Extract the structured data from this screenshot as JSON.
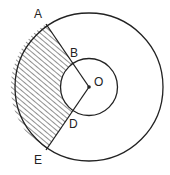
{
  "diagram": {
    "type": "concentric-circles-shaded-region",
    "center": {
      "label": "O",
      "x": 89,
      "y": 87
    },
    "outer_circle": {
      "r": 74
    },
    "inner_circle": {
      "r": 28.5
    },
    "points": [
      {
        "label": "A",
        "x": 46,
        "y": 24,
        "on": "outer"
      },
      {
        "label": "B",
        "x": 73,
        "y": 63,
        "on": "inner"
      },
      {
        "label": "O",
        "x": 89,
        "y": 87,
        "on": "center"
      },
      {
        "label": "D",
        "x": 73,
        "y": 111,
        "on": "inner"
      },
      {
        "label": "E",
        "x": 46,
        "y": 150,
        "on": "outer"
      }
    ],
    "segments": [
      "A-O",
      "E-O"
    ],
    "shaded_region": "ABDE (between arcs AE of outer circle and BD of inner circle)",
    "colors": {
      "stroke": "#222222",
      "hatch": "#333333",
      "background": "#ffffff"
    }
  },
  "labels": {
    "A": "A",
    "B": "B",
    "O": "O",
    "D": "D",
    "E": "E"
  }
}
